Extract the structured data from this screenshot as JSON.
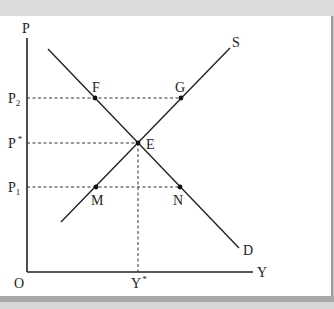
{
  "diagram": {
    "type": "supply-demand",
    "axes": {
      "y_label": "P",
      "x_label": "Y",
      "origin_label": "O"
    },
    "price_levels": [
      {
        "id": "p2",
        "label": "P",
        "sub": "2",
        "y": 98
      },
      {
        "id": "pstar",
        "label": "P",
        "sup": "*",
        "y": 143
      },
      {
        "id": "p1",
        "label": "P",
        "sub": "1",
        "y": 187
      }
    ],
    "quantity_levels": [
      {
        "id": "ystar",
        "label": "Y",
        "sup": "*",
        "x": 138
      }
    ],
    "curves": [
      {
        "name": "S",
        "label": "S",
        "from": [
          61,
          222
        ],
        "to": [
          230,
          48
        ]
      },
      {
        "name": "D",
        "label": "D",
        "from": [
          48,
          49
        ],
        "to": [
          239,
          248
        ]
      }
    ],
    "points": [
      {
        "label": "F",
        "x": 95,
        "y": 98
      },
      {
        "label": "G",
        "x": 181,
        "y": 98
      },
      {
        "label": "E",
        "x": 138,
        "y": 143
      },
      {
        "label": "M",
        "x": 96,
        "y": 187
      },
      {
        "label": "N",
        "x": 180,
        "y": 187
      }
    ]
  }
}
